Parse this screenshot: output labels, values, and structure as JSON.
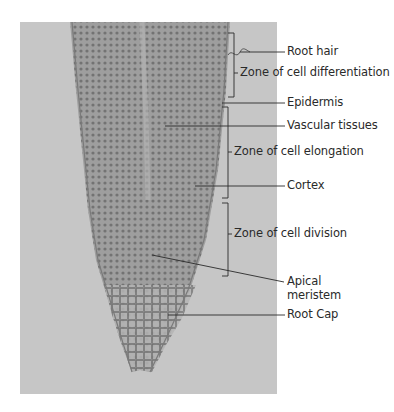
{
  "figure": {
    "labels": {
      "root_hair": "Root hair",
      "zone_differentiation": "Zone of cell differentiation",
      "epidermis": "Epidermis",
      "vascular_tissues": "Vascular tissues",
      "zone_elongation": "Zone of cell elongation",
      "cortex": "Cortex",
      "zone_division": "Zone of cell division",
      "apical_meristem_line1": "Apical",
      "apical_meristem_line2": "meristem",
      "root_cap": "Root Cap"
    },
    "colors": {
      "background": "#ffffff",
      "photo_background": "#c9c9c9",
      "tissue": "#8c8c8c",
      "leader_lines": "#2a2a2a",
      "text": "#2a2a2a"
    }
  }
}
